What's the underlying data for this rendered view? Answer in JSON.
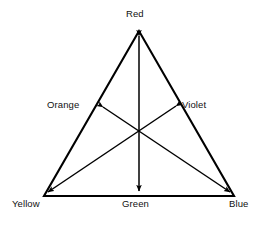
{
  "diagram": {
    "type": "color-triangle",
    "title": "",
    "stroke_color": "#000000",
    "background_color": "#ffffff",
    "vertices": [
      {
        "id": "red",
        "label": "Red",
        "position": "top-apex",
        "x": 139,
        "y": 31
      },
      {
        "id": "yellow",
        "label": "Yellow",
        "position": "bottom-left",
        "x": 44,
        "y": 196
      },
      {
        "id": "blue",
        "label": "Blue",
        "position": "bottom-right",
        "x": 234,
        "y": 196
      }
    ],
    "midpoints": [
      {
        "id": "orange",
        "label": "Orange",
        "position": "left-edge",
        "x": 101,
        "y": 105
      },
      {
        "id": "violet",
        "label": "Violet",
        "position": "right-edge",
        "x": 177,
        "y": 105
      },
      {
        "id": "green",
        "label": "Green",
        "position": "bottom-edge",
        "x": 139,
        "y": 196
      }
    ],
    "center": {
      "x": 139,
      "y": 133
    },
    "arrows": [
      {
        "id": "red-green-axis",
        "from": "Red",
        "to": "Green",
        "double_headed": true
      },
      {
        "id": "orange-blue-axis",
        "from": "Orange",
        "to": "Blue",
        "double_headed": true
      },
      {
        "id": "violet-yellow-axis",
        "from": "Violet",
        "to": "Yellow",
        "double_headed": true
      }
    ]
  },
  "labels": {
    "red": "Red",
    "orange": "Orange",
    "violet": "Violet",
    "yellow": "Yellow",
    "green": "Green",
    "blue": "Blue"
  },
  "footer": {
    "artifact_text": ""
  }
}
